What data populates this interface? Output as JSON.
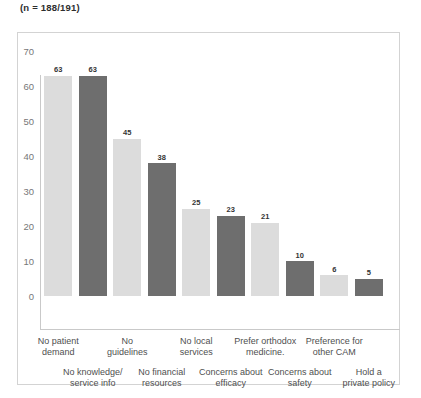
{
  "header": {
    "sample_note": "(n = 188/191)"
  },
  "colors": {
    "bar_light": "#dcdcdc",
    "bar_dark": "#6e6e6e",
    "frame_border": "#d3d3d3",
    "axis_line": "#c9c9c9",
    "tick_text": "#777777",
    "label_text": "#4f4f4f",
    "value_text": "#333333",
    "background": "#ffffff"
  },
  "chart_data": {
    "type": "bar",
    "title": "(n = 188/191)",
    "xlabel": "",
    "ylabel": "",
    "ylim": [
      0,
      70
    ],
    "yticks": [
      0,
      10,
      20,
      30,
      40,
      50,
      60,
      70
    ],
    "grid": false,
    "legend": "none",
    "value_labels": true,
    "categories": [
      "No patient\ndemand",
      "No knowledge/\nservice info",
      "No\nguidelines",
      "No financial\nresources",
      "No local\nservices",
      "Concerns about\nefficacy",
      "Prefer orthodox\nmedicine.",
      "Concerns about\nsafety",
      "Preference for\nother CAM",
      "Hold a\nprivate policy"
    ],
    "values": [
      63,
      63,
      45,
      38,
      25,
      23,
      21,
      10,
      6,
      5
    ],
    "bar_colors": [
      "#dcdcdc",
      "#6e6e6e",
      "#dcdcdc",
      "#6e6e6e",
      "#dcdcdc",
      "#6e6e6e",
      "#dcdcdc",
      "#6e6e6e",
      "#dcdcdc",
      "#6e6e6e"
    ],
    "label_rows": [
      "top",
      "bottom",
      "top",
      "bottom",
      "top",
      "bottom",
      "top",
      "bottom",
      "top",
      "bottom"
    ]
  }
}
